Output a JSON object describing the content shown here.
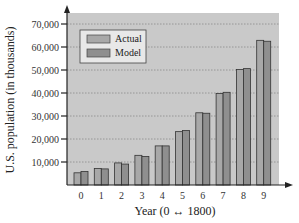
{
  "chart_data": {
    "type": "bar",
    "title": "",
    "xlabel": "Year (0 ↔ 1800)",
    "ylabel": "U.S. population (in thousands)",
    "categories": [
      "0",
      "1",
      "2",
      "3",
      "4",
      "5",
      "6",
      "7",
      "8",
      "9"
    ],
    "series": [
      {
        "name": "Actual",
        "values": [
          5300,
          7200,
          9600,
          12900,
          17000,
          23200,
          31400,
          39800,
          50200,
          62900
        ],
        "color": "#a8a8a8"
      },
      {
        "name": "Model",
        "values": [
          5900,
          7000,
          9100,
          12400,
          17000,
          23700,
          31200,
          40300,
          50600,
          62500
        ],
        "color": "#8f8f8f"
      }
    ],
    "ylim": [
      0,
      75000
    ],
    "yticks": [
      10000,
      20000,
      30000,
      40000,
      50000,
      60000,
      70000
    ],
    "ytick_labels": [
      "10,000",
      "20,000",
      "30,000",
      "40,000",
      "50,000",
      "60,000",
      "70,000"
    ],
    "grid": true,
    "legend_position": "upper left",
    "plot_background": "#c9c9c9"
  }
}
